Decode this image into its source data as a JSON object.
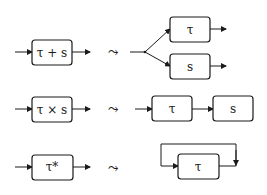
{
  "rows": [
    {
      "name": "choice",
      "left_label": "τ + s",
      "transform_symbol": "⤳",
      "right_labels": [
        "τ",
        "s"
      ]
    },
    {
      "name": "sequence",
      "left_label": "τ × s",
      "transform_symbol": "⤳",
      "right_labels": [
        "τ",
        "s"
      ]
    },
    {
      "name": "iteration",
      "left_label": "τ*",
      "transform_symbol": "⤳",
      "right_labels": [
        "τ"
      ]
    }
  ],
  "colors": {
    "stroke": "#1a1a1a",
    "background": "#ffffff"
  }
}
